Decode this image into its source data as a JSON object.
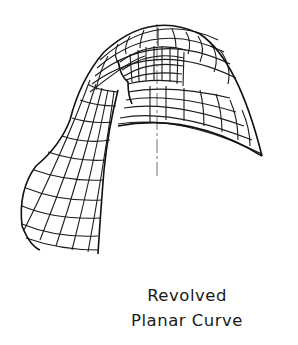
{
  "figure": {
    "axis_color": "#9a9a9a",
    "mesh_color": "#1c1c1c"
  },
  "caption": {
    "line1": "Revolved",
    "line2": "Planar Curve"
  }
}
